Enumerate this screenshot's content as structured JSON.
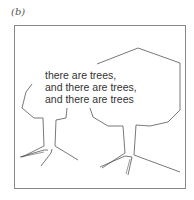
{
  "figure": {
    "label": "(b)",
    "text_lines": [
      "there are trees,",
      "and there are trees,",
      "and there are trees"
    ],
    "colors": {
      "frame": "#888888",
      "stroke": "#555555",
      "text": "#333333"
    }
  }
}
